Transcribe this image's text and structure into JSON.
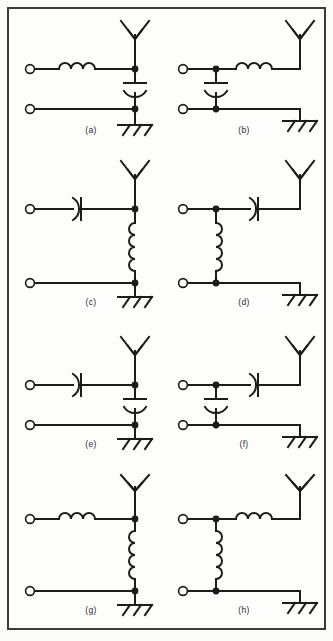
{
  "figure": {
    "background_color": "#fbfbf9",
    "line_color": "#1c1c1c",
    "border_color": "#3a3a3a",
    "layout": {
      "rows": 4,
      "columns": 2,
      "total_circuits": 8
    }
  },
  "symbols": {
    "antenna": "antenna-icon",
    "ground": "chassis-ground-icon",
    "inductor": "inductor-coil-icon",
    "capacitor": "capacitor-icon",
    "terminal": "open-terminal-icon",
    "junction": "junction-dot-icon"
  },
  "circuits": [
    {
      "id": "a",
      "caption": "(a)",
      "series_element": "inductor",
      "series_orientation": "horizontal",
      "shunt_element": "capacitor",
      "shunt_orientation": "vertical",
      "topology": "series-inductor-then-shunt-capacitor",
      "antenna_side": "right",
      "ground": "bottom-right"
    },
    {
      "id": "b",
      "caption": "(b)",
      "series_element": "inductor",
      "series_orientation": "horizontal",
      "shunt_element": "capacitor",
      "shunt_orientation": "vertical",
      "topology": "shunt-capacitor-then-series-inductor",
      "antenna_side": "right",
      "ground": "bottom-right"
    },
    {
      "id": "c",
      "caption": "(c)",
      "series_element": "capacitor",
      "series_orientation": "horizontal",
      "shunt_element": "inductor",
      "shunt_orientation": "vertical",
      "topology": "series-capacitor-then-shunt-inductor",
      "antenna_side": "right",
      "ground": "bottom-right"
    },
    {
      "id": "d",
      "caption": "(d)",
      "series_element": "capacitor",
      "series_orientation": "horizontal",
      "shunt_element": "inductor",
      "shunt_orientation": "vertical",
      "topology": "shunt-inductor-then-series-capacitor",
      "antenna_side": "right",
      "ground": "bottom-right"
    },
    {
      "id": "e",
      "caption": "(e)",
      "series_element": "capacitor",
      "series_orientation": "horizontal",
      "shunt_element": "capacitor",
      "shunt_orientation": "vertical",
      "topology": "series-capacitor-then-shunt-capacitor",
      "antenna_side": "right",
      "ground": "bottom-right"
    },
    {
      "id": "f",
      "caption": "(f)",
      "series_element": "capacitor",
      "series_orientation": "horizontal",
      "shunt_element": "capacitor",
      "shunt_orientation": "vertical",
      "topology": "shunt-capacitor-then-series-capacitor",
      "antenna_side": "right",
      "ground": "bottom-right"
    },
    {
      "id": "g",
      "caption": "(g)",
      "series_element": "inductor",
      "series_orientation": "horizontal",
      "shunt_element": "inductor",
      "shunt_orientation": "vertical",
      "topology": "series-inductor-then-shunt-inductor",
      "antenna_side": "right",
      "ground": "bottom-right"
    },
    {
      "id": "h",
      "caption": "(h)",
      "series_element": "inductor",
      "series_orientation": "horizontal",
      "shunt_element": "inductor",
      "shunt_orientation": "vertical",
      "topology": "shunt-inductor-then-series-inductor",
      "antenna_side": "right",
      "ground": "bottom-right"
    }
  ]
}
